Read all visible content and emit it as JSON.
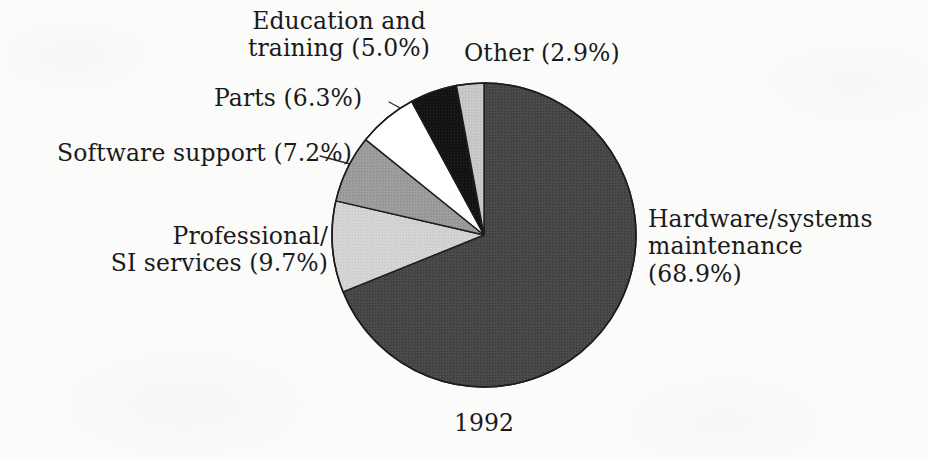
{
  "figure": {
    "caption": "1992",
    "background_color": "#fbfbfa",
    "text_color": "#1a1a1a"
  },
  "chart_data": {
    "type": "pie",
    "title": "",
    "subtitle": "",
    "caption": "1992",
    "xlabel": "",
    "ylabel": "",
    "grid": false,
    "legend_position": "none",
    "labels_position": "outside-with-leader-lines",
    "start_angle_deg": 0,
    "direction": "clockwise",
    "units": "percent",
    "total": 100.0,
    "categories": [
      "Hardware/systems maintenance",
      "Professional/SI services",
      "Software support",
      "Parts",
      "Education and training",
      "Other"
    ],
    "values": [
      68.9,
      9.7,
      7.2,
      6.3,
      5.0,
      2.9
    ],
    "colors": [
      "#4a4a4a",
      "#d2d2d2",
      "#9a9a9a",
      "#ffffff",
      "#111111",
      "#c6c6c6"
    ],
    "slices": [
      {
        "name": "Hardware/systems maintenance",
        "value": 68.9,
        "value_text": "68.9%",
        "label": "Hardware/systems maintenance (68.9%)",
        "label_line_1": "Hardware/systems",
        "label_line_2": "maintenance (68.9%)",
        "color": "#4a4a4a",
        "start_deg": 0.0,
        "end_deg": 248.04
      },
      {
        "name": "Professional/SI services",
        "value": 9.7,
        "value_text": "9.7%",
        "label": "Professional/ SI services (9.7%)",
        "label_line_1": "Professional/",
        "label_line_2": "SI services (9.7%)",
        "color": "#d2d2d2",
        "start_deg": 248.04,
        "end_deg": 282.96
      },
      {
        "name": "Software support",
        "value": 7.2,
        "value_text": "7.2%",
        "label": "Software support (7.2%)",
        "label_line_1": "Software support (7.2%)",
        "label_line_2": "",
        "color": "#9a9a9a",
        "start_deg": 282.96,
        "end_deg": 308.88
      },
      {
        "name": "Parts",
        "value": 6.3,
        "value_text": "6.3%",
        "label": "Parts (6.3%)",
        "label_line_1": "Parts (6.3%)",
        "label_line_2": "",
        "color": "#ffffff",
        "start_deg": 308.88,
        "end_deg": 331.56
      },
      {
        "name": "Education and training",
        "value": 5.0,
        "value_text": "5.0%",
        "label": "Education and training (5.0%)",
        "label_line_1": "Education and",
        "label_line_2": "training (5.0%)",
        "color": "#111111",
        "start_deg": 331.56,
        "end_deg": 349.56
      },
      {
        "name": "Other",
        "value": 2.9,
        "value_text": "2.9%",
        "label": "Other (2.9%)",
        "label_line_1": "Other (2.9%)",
        "label_line_2": "",
        "color": "#c6c6c6",
        "start_deg": 349.56,
        "end_deg": 360.0
      }
    ]
  }
}
